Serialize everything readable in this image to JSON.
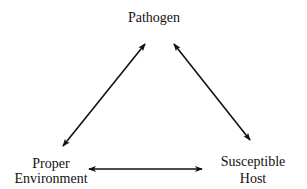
{
  "diagram": {
    "nodes": {
      "top": {
        "label": "Pathogen"
      },
      "left": {
        "line1": "Proper",
        "line2": "Environment"
      },
      "right": {
        "line1": "Susceptible",
        "line2": "Host"
      }
    },
    "edges": [
      {
        "from": "Pathogen",
        "to": "Proper Environment",
        "type": "bidirectional"
      },
      {
        "from": "Pathogen",
        "to": "Susceptible Host",
        "type": "bidirectional"
      },
      {
        "from": "Proper Environment",
        "to": "Susceptible Host",
        "type": "bidirectional"
      }
    ]
  }
}
